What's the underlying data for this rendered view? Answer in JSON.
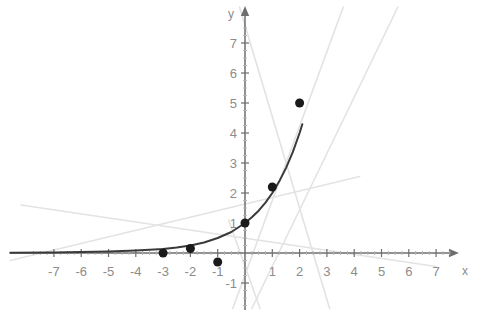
{
  "figure": {
    "background": "#ffffff",
    "axis_color": "#6e6e6e",
    "tick_label_color": "#8c8c8c",
    "curve_color": "#3a3a3a",
    "point_color": "#1a1a1a",
    "faint_line_color": "#e3e3e3",
    "axis_label_x": "x",
    "axis_label_y": "y"
  },
  "geometry": {
    "origin_x": 245,
    "origin_y": 253,
    "unit_x": 27.3,
    "unit_y": 30.0,
    "width": 499,
    "height": 331
  },
  "chart_data": {
    "type": "scatter",
    "title": "",
    "xlabel": "x",
    "ylabel": "y",
    "grid": false,
    "legend": "none",
    "xlim": [
      -8.6,
      7.8
    ],
    "ylim": [
      -1.9,
      8.2
    ],
    "xticks": [
      -7,
      -6,
      -5,
      -4,
      -3,
      -2,
      -1,
      1,
      2,
      3,
      4,
      5,
      6,
      7
    ],
    "xtick_labels": [
      "-7",
      "-6",
      "-5",
      "-4",
      "-3",
      "-2",
      "-1",
      "1",
      "2",
      "3",
      "4",
      "5",
      "6",
      "7"
    ],
    "yticks": [
      -1,
      1,
      2,
      3,
      4,
      5,
      6,
      7
    ],
    "ytick_labels": [
      "-1",
      "1",
      "2",
      "3",
      "4",
      "5",
      "6",
      "7"
    ],
    "series": [
      {
        "name": "data points",
        "type": "scatter",
        "color": "#1a1a1a",
        "marker": "circle",
        "marker_size": 9,
        "points": [
          {
            "x": -3,
            "y": 0
          },
          {
            "x": -2,
            "y": 0.15
          },
          {
            "x": -1,
            "y": -0.3
          },
          {
            "x": 0,
            "y": 1
          },
          {
            "x": 1,
            "y": 2.2
          },
          {
            "x": 2,
            "y": 5
          }
        ]
      },
      {
        "name": "exponential curve",
        "type": "line",
        "color": "#3a3a3a",
        "width": 2,
        "x": [
          -8.6,
          -7,
          -6,
          -5,
          -4,
          -3,
          -2.5,
          -2,
          -1.5,
          -1,
          -0.5,
          0,
          0.25,
          0.5,
          0.75,
          1,
          1.25,
          1.5,
          1.75,
          2,
          2.1
        ],
        "y": [
          0.01,
          0.02,
          0.03,
          0.05,
          0.08,
          0.13,
          0.18,
          0.25,
          0.35,
          0.5,
          0.7,
          1,
          1.19,
          1.41,
          1.68,
          2,
          2.38,
          2.83,
          3.36,
          4,
          4.29
        ]
      }
    ],
    "faint_lines": [
      {
        "name": "faint-line-1",
        "x1": -8.2,
        "y1": 1.6,
        "x2": 7.0,
        "y2": -0.45
      },
      {
        "name": "faint-line-2",
        "x1": -8.6,
        "y1": -0.25,
        "x2": 4.2,
        "y2": 2.55
      },
      {
        "name": "faint-line-3",
        "x1": -0.45,
        "y1": -1.85,
        "x2": 3.6,
        "y2": 8.2
      },
      {
        "name": "faint-line-4",
        "x1": -0.2,
        "y1": 8.2,
        "x2": 3.1,
        "y2": -1.85
      },
      {
        "name": "faint-line-5",
        "x1": 0.25,
        "y1": -1.85,
        "x2": 5.6,
        "y2": 8.2
      },
      {
        "name": "faint-line-6",
        "x1": -0.6,
        "y1": 1.1,
        "x2": 0.55,
        "y2": -1.85
      }
    ]
  }
}
